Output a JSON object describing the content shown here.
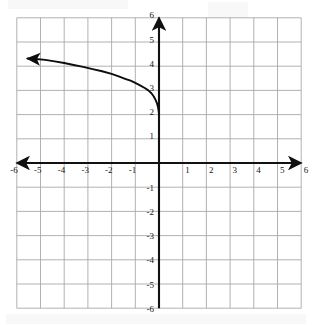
{
  "figure": {
    "title": "",
    "background_color": "#ffffff",
    "grid_color": "#a9a9a9",
    "axis_color": "#111111",
    "curve_color": "#0d0d0d"
  },
  "axes": {
    "x_label": "",
    "y_label": "",
    "x_ticks": [
      "-6",
      "-5",
      "-4",
      "-3",
      "-2",
      "-1",
      "1",
      "2",
      "3",
      "4",
      "5",
      "6"
    ],
    "y_ticks": [
      "6",
      "5",
      "4",
      "3",
      "2",
      "1",
      "-1",
      "-2",
      "-3",
      "-4",
      "-5",
      "-6"
    ],
    "x_arrowheads": [
      "left",
      "right"
    ],
    "y_arrowheads": [
      "top"
    ]
  },
  "chart_data": {
    "type": "line",
    "title": "",
    "xlabel": "",
    "ylabel": "",
    "xlim": [
      -6,
      6
    ],
    "ylim": [
      -6,
      6
    ],
    "grid": true,
    "grid_step": 1,
    "legend": "none",
    "series": [
      {
        "name": "curve",
        "description": "decreasing logarithmic curve in the second quadrant, asymptotic to the y-axis near y=2, with a leftward arrowhead",
        "arrow_end": "left",
        "x": [
          -5.55,
          -5.2,
          -4.8,
          -4.4,
          -4.0,
          -3.6,
          -3.2,
          -2.8,
          -2.4,
          -2.0,
          -1.7,
          -1.4,
          -1.2,
          -1.0,
          -0.8,
          -0.6,
          -0.45,
          -0.32,
          -0.22,
          -0.14,
          -0.08,
          -0.04,
          -0.015,
          0.0
        ],
        "y": [
          4.32,
          4.3,
          4.26,
          4.2,
          4.13,
          4.05,
          3.97,
          3.88,
          3.79,
          3.68,
          3.58,
          3.47,
          3.4,
          3.31,
          3.21,
          3.1,
          3.0,
          2.88,
          2.75,
          2.6,
          2.45,
          2.3,
          2.15,
          2.02
        ]
      }
    ],
    "annotations": [
      {
        "name": "arrow-tip",
        "x": -5.55,
        "y": 4.32
      },
      {
        "name": "y-axis-touch-point",
        "x": 0.0,
        "y": 2.02
      }
    ]
  }
}
